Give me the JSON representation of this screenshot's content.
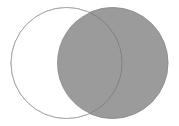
{
  "figure": {
    "name": "venn-diagram",
    "type": "venn",
    "width": 179,
    "height": 126,
    "background_color": "#ffffff",
    "caption": ""
  },
  "colors": {
    "background": "#ffffff",
    "shaded_fill": "#9b9b9b",
    "unshaded_fill": "#ffffff",
    "outline_light": "#a6a6a6",
    "outline_overlap": "#7d7d7d",
    "outline_right": "#8f8f8f"
  },
  "chart_data": {
    "type": "venn",
    "title": "",
    "xlabel": "",
    "ylabel": "",
    "grid": false,
    "legend_position": "none",
    "sets": [
      {
        "id": "left",
        "label": "",
        "cx": 66.5,
        "cy": 63,
        "r": 55.5,
        "fill": "#ffffff",
        "stroke": "#a6a6a6",
        "stroke_width": 1,
        "shaded": false
      },
      {
        "id": "right",
        "label": "",
        "cx": 112.5,
        "cy": 63,
        "r": 55.5,
        "fill": "#9b9b9b",
        "stroke": "#8f8f8f",
        "stroke_width": 1,
        "shaded": true
      }
    ],
    "regions": [
      {
        "id": "left-only",
        "shaded": false,
        "fill": "#ffffff"
      },
      {
        "id": "intersection",
        "shaded": true,
        "fill": "#9b9b9b"
      },
      {
        "id": "right-only",
        "shaded": true,
        "fill": "#9b9b9b"
      }
    ],
    "intersection_points": [
      {
        "x": 89,
        "y": 7
      },
      {
        "x": 89,
        "y": 119
      }
    ],
    "annotations": []
  }
}
